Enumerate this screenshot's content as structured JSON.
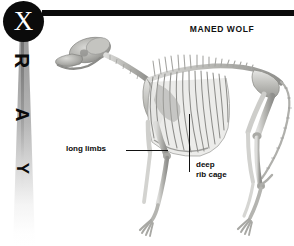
{
  "page": {
    "background_color": "#ffffff",
    "width": 294,
    "height": 246
  },
  "masthead": {
    "badge_letter": "X",
    "badge_color": "#0b0b0b",
    "badge_text_color": "#ffffff",
    "vertical_word_letters": [
      "R",
      "A",
      "Y"
    ],
    "full_word": "X-RAY",
    "beam_color": "#9a9a9a",
    "rule_color": "#0b0b0b"
  },
  "header": {
    "title": "MANED WOLF",
    "title_color": "#111111"
  },
  "artwork": {
    "subject": "maned wolf skeleton",
    "view": "lateral",
    "bone_color": "#b8b8b4",
    "bone_shadow_color": "#8d8d8a",
    "bone_highlight_color": "#e8e8e6"
  },
  "callouts": [
    {
      "id": "long-limbs",
      "label": "long limbs",
      "lines": [
        "long limbs"
      ],
      "leader": "horizontal",
      "color": "#0b0b0b"
    },
    {
      "id": "deep-rib-cage",
      "label": "deep rib cage",
      "lines": [
        "deep",
        "rib cage"
      ],
      "leader": "vertical",
      "color": "#0b0b0b"
    }
  ]
}
